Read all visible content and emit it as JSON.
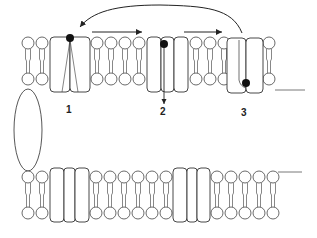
{
  "diagram": {
    "labels": {
      "protein1": "1",
      "protein2": "2",
      "protein3": "3"
    },
    "colors": {
      "line": "#333333",
      "fill": "#ffffff",
      "marker": "#111111"
    },
    "top_membrane": {
      "lipid_x": [
        28,
        42,
        97,
        111,
        125,
        139,
        196,
        210,
        224,
        269
      ],
      "proteins": [
        {
          "id": "1",
          "x": 50,
          "w": 40,
          "subunits": 2
        },
        {
          "id": "2",
          "x": 147,
          "w": 41,
          "subunits": 3
        },
        {
          "id": "3",
          "x": 229,
          "w": 34,
          "subunits": 2
        }
      ]
    },
    "bottom_membrane": {
      "lipid_x": [
        28,
        42,
        96,
        110,
        124,
        138,
        152,
        166,
        217,
        231,
        245,
        259,
        273
      ],
      "proteins": [
        {
          "x": 50,
          "w": 38,
          "subunits": 3
        },
        {
          "x": 173,
          "w": 37,
          "subunits": 3
        }
      ]
    }
  }
}
